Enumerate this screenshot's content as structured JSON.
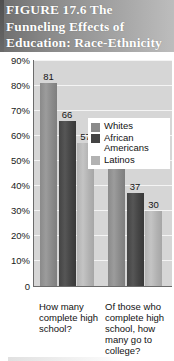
{
  "figure": {
    "number_label": "FIGURE 17.6",
    "title": "The Funneling Effects of Education: Race-Ethnicity",
    "title_line1": "FIGURE 17.6   The",
    "title_line2": "Funneling Effects of",
    "title_line3": "Education: Race-Ethnicity"
  },
  "colors": {
    "whites": "#8a8a8a",
    "african_americans": "#444444",
    "latinos": "#b2b2b2",
    "plot_background": "#d6d6d6",
    "gridline": "#f4f4f4",
    "axis": "#6b6b6b",
    "header_dark": "#6e6e6e",
    "header_light": "#bdbdbd",
    "title_text": "#ffffff"
  },
  "legend": {
    "position": "top-right",
    "entries": [
      {
        "label": "Whites",
        "color": "#8a8a8a"
      },
      {
        "label": "African Americans",
        "color": "#444444"
      },
      {
        "label": "Latinos",
        "color": "#b2b2b2"
      }
    ]
  },
  "y_axis": {
    "ticks": [
      "90%",
      "80%",
      "70%",
      "60%",
      "50%",
      "40%",
      "30%",
      "20%",
      "10%",
      "0"
    ],
    "min": 0,
    "max": 90
  },
  "x_axis": {
    "categories": [
      "How many complete high school?",
      "Of those who complete high school, how many go to college?"
    ]
  },
  "chart_data": {
    "type": "bar",
    "title": "The Funneling Effects of Education: Race-Ethnicity",
    "xlabel": "",
    "ylabel": "",
    "ylim": [
      0,
      90
    ],
    "ytick_labels": [
      "0",
      "10%",
      "20%",
      "30%",
      "40%",
      "50%",
      "60%",
      "70%",
      "80%",
      "90%"
    ],
    "grid": true,
    "legend_position": "top-right",
    "categories": [
      "How many complete high school?",
      "Of those who complete high school, how many go to college?"
    ],
    "series": [
      {
        "name": "Whites",
        "color": "#8a8a8a",
        "values": [
          81,
          49
        ]
      },
      {
        "name": "African Americans",
        "color": "#444444",
        "values": [
          66,
          37
        ]
      },
      {
        "name": "Latinos",
        "color": "#b2b2b2",
        "values": [
          57,
          30
        ]
      }
    ],
    "data_labels": [
      "81",
      "66",
      "57",
      "49",
      "37",
      "30"
    ]
  }
}
